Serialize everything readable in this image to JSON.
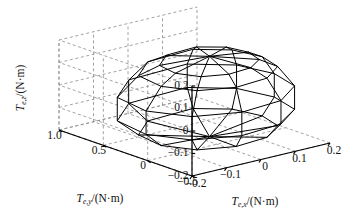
{
  "figure": {
    "kind": "3d-wireframe-surface",
    "background": "#ffffff",
    "line_color": "#000000",
    "grid_color": "#8c8c8c",
    "axis_color": "#000000"
  },
  "chart_data": {
    "type": "surface3d",
    "title": "",
    "xlabel": "Te,x/(N·m)",
    "ylabel": "Te,y/(N·m)",
    "zlabel": "Te,z/(N·m)",
    "xlabel_parts": {
      "base": "T",
      "sub": "e,x",
      "unit": "/(N·m)"
    },
    "ylabel_parts": {
      "base": "T",
      "sub": "e,y",
      "unit": "/(N·m)"
    },
    "zlabel_parts": {
      "base": "T",
      "sub": "e,z",
      "unit": "/(N·m)"
    },
    "xticks": [
      -0.2,
      -0.1,
      0,
      0.1,
      0.2
    ],
    "xticklabels": [
      "−0.2",
      "−0.1",
      "0",
      "0.1",
      "0.2"
    ],
    "yticks": [
      -0.5,
      0,
      0.5,
      1.0
    ],
    "yticklabels": [
      "−0.5",
      "0",
      "0.5",
      "1.0"
    ],
    "zticks": [
      -0.2,
      -0.1,
      0,
      0.1,
      0.2
    ],
    "zticklabels": [
      "−0.2",
      "−0.1",
      "0",
      "0.1",
      "0.2"
    ],
    "xlim": [
      -0.2,
      0.2
    ],
    "ylim": [
      -0.5,
      1.0
    ],
    "zlim": [
      -0.2,
      0.2
    ],
    "grid": true,
    "legend": null,
    "view": {
      "azimuth": -37.5,
      "elevation": 22
    },
    "rings": [
      {
        "z": 0.152,
        "pts": [
          [
            0.055,
            0.44
          ],
          [
            0.105,
            0.3
          ],
          [
            0.118,
            0.1
          ],
          [
            0.1,
            -0.09
          ],
          [
            0.045,
            -0.21
          ],
          [
            -0.025,
            -0.235
          ],
          [
            -0.085,
            -0.155
          ],
          [
            -0.112,
            0.03
          ],
          [
            -0.1,
            0.255
          ],
          [
            -0.04,
            0.415
          ]
        ]
      },
      {
        "z": 0.108,
        "pts": [
          [
            0.086,
            0.6
          ],
          [
            0.15,
            0.41
          ],
          [
            0.168,
            0.14
          ],
          [
            0.146,
            -0.12
          ],
          [
            0.07,
            -0.295
          ],
          [
            -0.028,
            -0.33
          ],
          [
            -0.112,
            -0.215
          ],
          [
            -0.152,
            0.035
          ],
          [
            -0.138,
            0.345
          ],
          [
            -0.055,
            0.565
          ]
        ]
      },
      {
        "z": 0.012,
        "pts": [
          [
            0.11,
            0.76
          ],
          [
            0.19,
            0.515
          ],
          [
            0.212,
            0.175
          ],
          [
            0.186,
            -0.155
          ],
          [
            0.09,
            -0.375
          ],
          [
            -0.035,
            -0.42
          ],
          [
            -0.142,
            -0.275
          ],
          [
            -0.193,
            0.045
          ],
          [
            -0.175,
            0.44
          ],
          [
            -0.07,
            0.72
          ]
        ]
      },
      {
        "z": -0.092,
        "pts": [
          [
            0.11,
            0.76
          ],
          [
            0.19,
            0.515
          ],
          [
            0.212,
            0.175
          ],
          [
            0.186,
            -0.155
          ],
          [
            0.09,
            -0.375
          ],
          [
            -0.035,
            -0.42
          ],
          [
            -0.142,
            -0.275
          ],
          [
            -0.193,
            0.045
          ],
          [
            -0.175,
            0.44
          ],
          [
            -0.07,
            0.72
          ]
        ]
      },
      {
        "z": -0.155,
        "pts": [
          [
            0.086,
            0.6
          ],
          [
            0.15,
            0.41
          ],
          [
            0.168,
            0.14
          ],
          [
            0.146,
            -0.12
          ],
          [
            0.07,
            -0.295
          ],
          [
            -0.028,
            -0.33
          ],
          [
            -0.112,
            -0.215
          ],
          [
            -0.152,
            0.035
          ],
          [
            -0.138,
            0.345
          ],
          [
            -0.055,
            0.565
          ]
        ]
      }
    ],
    "top_apex": [
      0.005,
      0.1,
      0.175
    ],
    "bottom_apex": [
      0.005,
      0.1,
      -0.182
    ]
  }
}
